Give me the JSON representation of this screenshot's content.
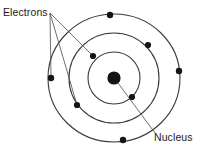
{
  "diagram": {
    "background_color": "#ffffff",
    "orbit_color": "#3a3a3a",
    "electron_color": "#151515",
    "nucleus_color": "#141414",
    "leader_color": "#4a4a4a",
    "center": {
      "x": 114,
      "y": 78
    },
    "nucleus": {
      "label": "Nucleus",
      "radius": 6.6,
      "leader_from": {
        "x": 118,
        "y": 83
      },
      "leader_to": {
        "x": 155,
        "y": 133
      }
    },
    "electrons_label": {
      "label": "Electrons",
      "anchor": {
        "x": 50,
        "y": 13
      },
      "leader_targets": [
        {
          "x": 93,
          "y": 56
        },
        {
          "x": 51,
          "y": 78
        },
        {
          "x": 77,
          "y": 105
        }
      ]
    },
    "orbits": [
      {
        "name": "inner-orbit",
        "rx": 26,
        "ry": 26,
        "electrons": [
          {
            "name": "electron-inner-upper-left",
            "x": 93,
            "y": 56,
            "r": 3.1
          },
          {
            "name": "electron-inner-lower-right",
            "x": 132,
            "y": 97,
            "r": 3.1
          }
        ]
      },
      {
        "name": "middle-orbit",
        "rx": 45,
        "ry": 45,
        "electrons": [
          {
            "name": "electron-middle-right",
            "x": 148,
            "y": 45,
            "r": 3.1
          },
          {
            "name": "electron-middle-lower-left",
            "x": 77,
            "y": 105,
            "r": 3.1
          }
        ]
      },
      {
        "name": "outer-orbit",
        "rx": 66,
        "ry": 64,
        "electrons": [
          {
            "name": "electron-outer-top",
            "x": 110,
            "y": 15,
            "r": 3.2
          },
          {
            "name": "electron-outer-right",
            "x": 179,
            "y": 71,
            "r": 3.2
          },
          {
            "name": "electron-outer-left",
            "x": 51,
            "y": 78,
            "r": 3.2
          },
          {
            "name": "electron-outer-bottom",
            "x": 123,
            "y": 140,
            "r": 3.2
          }
        ]
      }
    ]
  }
}
